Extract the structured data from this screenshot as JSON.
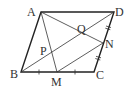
{
  "diagram": {
    "type": "parallelogram-geometry",
    "points": {
      "A": {
        "label": "A",
        "x": 41,
        "y": 12
      },
      "D": {
        "label": "D",
        "x": 114,
        "y": 12
      },
      "B": {
        "label": "B",
        "x": 21,
        "y": 72
      },
      "C": {
        "label": "C",
        "x": 94,
        "y": 72
      },
      "M": {
        "label": "M",
        "x": 57,
        "y": 72
      },
      "N": {
        "label": "N",
        "x": 103,
        "y": 43
      },
      "P": {
        "label": "P",
        "x": 45,
        "y": 50
      },
      "Q": {
        "label": "Q",
        "x": 82,
        "y": 28
      }
    },
    "segments": [
      "AB",
      "BC",
      "CD",
      "DA",
      "AM",
      "AN",
      "BD",
      "MN"
    ],
    "equal_marks": {
      "single_tick": [
        "BM",
        "MC"
      ],
      "double_tick": [
        "DN",
        "NC"
      ]
    },
    "colors": {
      "stroke": "#222222",
      "label": "#333333",
      "background": "#ffffff"
    }
  }
}
